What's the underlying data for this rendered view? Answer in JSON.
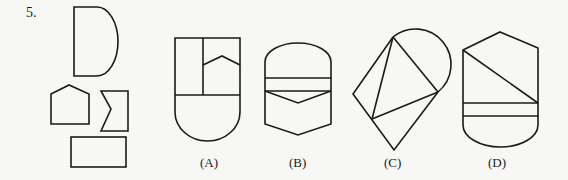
{
  "question": {
    "number": "5.",
    "pieces": [
      "D-shape",
      "pentagon",
      "notched-rectangle",
      "rectangle"
    ],
    "options": [
      {
        "label": "(A)"
      },
      {
        "label": "(B)"
      },
      {
        "label": "(C)"
      },
      {
        "label": "(D)"
      }
    ]
  },
  "colors": {
    "stroke": "#1a1a1a",
    "background": "#f7f7f5"
  }
}
